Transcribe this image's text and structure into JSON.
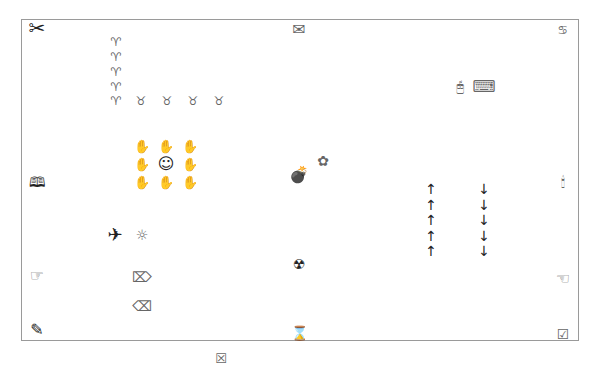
{
  "canvas": {
    "border_color": "#9a9a9a",
    "background": "#ffffff"
  },
  "glyphs": {
    "scissors": "✂",
    "envelope": "✉",
    "cancer_sign": "♋",
    "aries": [
      "♈",
      "♈",
      "♈",
      "♈",
      "♈"
    ],
    "taurus": [
      "♉",
      "♉",
      "♉",
      "♉"
    ],
    "mouse": "🖰",
    "keyboard": "⌨",
    "hands_row1": [
      "✋",
      "✋",
      "✋"
    ],
    "hands_row2_left": "✋",
    "smiley": "☺",
    "hands_row2_right": "✋",
    "hands_row3": [
      "✋",
      "✋",
      "✋"
    ],
    "book": "🕮",
    "bomb": "💣",
    "flower": "✿",
    "candle": "🕯",
    "up_arrows": [
      "↑",
      "↑",
      "↑",
      "↑",
      "↑"
    ],
    "down_arrows": [
      "↓",
      "↓",
      "↓",
      "↓",
      "↓"
    ],
    "airplane": "✈",
    "sun_dots": "☼",
    "point_right_hand": "☞",
    "point_left_hand": "☜",
    "erase_right": "⌦",
    "erase_left": "⌫",
    "radiation": "☢",
    "pencil": "✎",
    "hourglass": "⌛",
    "checkbox_checked": "☑",
    "checkbox_x": "☒"
  }
}
